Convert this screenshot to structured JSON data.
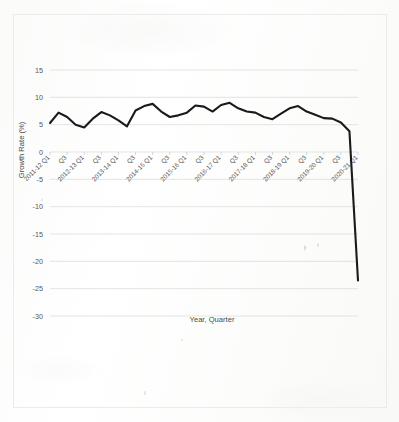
{
  "document": {
    "kind": "scanned-page",
    "background_color": "#ffffff",
    "page_border_color": "#ebebe9"
  },
  "chart_data": {
    "type": "line",
    "title": "",
    "xlabel": "Year, Quarter",
    "ylabel": "Growth Rate (%)",
    "ylim": [
      -30,
      15
    ],
    "yticks": [
      15,
      10,
      5,
      0,
      -5,
      -10,
      -15,
      -20,
      -25,
      -30
    ],
    "ytick_labels": [
      "15",
      "10",
      "5",
      "0",
      "-5",
      "-10",
      "-15",
      "-20",
      "-25",
      "-30"
    ],
    "grid": true,
    "legend": "none",
    "line_color": "#1a1a1a",
    "x_tick_labels": [
      "2011-12 Q1",
      "Q3",
      "2012-13 Q1",
      "Q3",
      "2013-14 Q1",
      "Q3",
      "2014-15 Q1",
      "Q3",
      "2015-16 Q1",
      "Q3",
      "2016-17 Q1",
      "Q3",
      "2017-18 Q1",
      "Q3",
      "2018-19 Q1",
      "Q3",
      "2019-20 Q1",
      "Q3",
      "2020-21 Q1"
    ],
    "categories": [
      "2011-12 Q1",
      "2011-12 Q2",
      "2011-12 Q3",
      "2011-12 Q4",
      "2012-13 Q1",
      "2012-13 Q2",
      "2012-13 Q3",
      "2012-13 Q4",
      "2013-14 Q1",
      "2013-14 Q2",
      "2013-14 Q3",
      "2013-14 Q4",
      "2014-15 Q1",
      "2014-15 Q2",
      "2014-15 Q3",
      "2014-15 Q4",
      "2015-16 Q1",
      "2015-16 Q2",
      "2015-16 Q3",
      "2015-16 Q4",
      "2016-17 Q1",
      "2016-17 Q2",
      "2016-17 Q3",
      "2016-17 Q4",
      "2017-18 Q1",
      "2017-18 Q2",
      "2017-18 Q3",
      "2017-18 Q4",
      "2018-19 Q1",
      "2018-19 Q2",
      "2018-19 Q3",
      "2018-19 Q4",
      "2019-20 Q1",
      "2019-20 Q2",
      "2019-20 Q3",
      "2019-20 Q4",
      "2020-21 Q1"
    ],
    "values": [
      5.3,
      7.2,
      6.4,
      5.0,
      4.5,
      6.1,
      7.3,
      6.7,
      5.8,
      4.7,
      7.6,
      8.4,
      8.8,
      7.4,
      6.4,
      6.7,
      7.2,
      8.5,
      8.3,
      7.4,
      8.6,
      9.0,
      8.0,
      7.4,
      7.2,
      6.4,
      6.0,
      7.0,
      8.0,
      8.4,
      7.4,
      6.8,
      6.2,
      6.1,
      5.4,
      3.8,
      -23.5
    ],
    "notes": {
      "first_value": 5.3,
      "peak_value": 9.0,
      "peak_category": "2016-17 Q2",
      "final_value": -23.5,
      "final_category": "2020-21 Q1"
    }
  }
}
